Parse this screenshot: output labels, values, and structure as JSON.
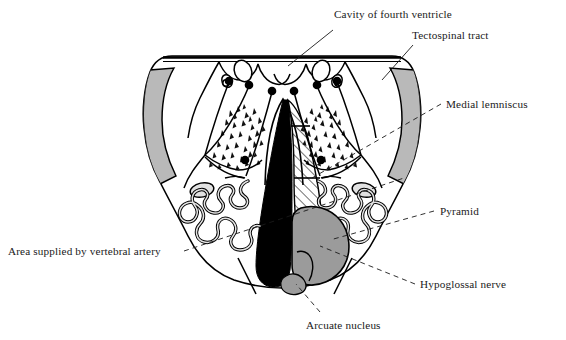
{
  "figure": {
    "background_color": "#ffffff",
    "outline_color": "#000000",
    "gray_light": "#b9b9b9",
    "gray_mid": "#9b9b9b",
    "gray_pale": "#e2e2e2",
    "black_fill": "#000000"
  },
  "labels": {
    "cavity_of_fourth_ventricle": "Cavity of fourth ventricle",
    "tectospinal_tract": "Tectospinal tract",
    "medial_lemniscus": "Medial lemniscus",
    "pyramid": "Pyramid",
    "hypoglossal_nerve": "Hypoglossal nerve",
    "arcuate_nucleus": "Arcuate nucleus",
    "area_supplied_by_vertebral_artery": "Area supplied by vertebral artery"
  },
  "structures": [
    {
      "id": "medulla-outline",
      "name": "Medulla oblongata outline",
      "fill": "#ffffff",
      "stroke": "#000000"
    },
    {
      "id": "vertebral-artery-left",
      "name": "Area supplied by vertebral artery (left)",
      "fill": "#b9b9b9"
    },
    {
      "id": "vertebral-artery-right",
      "name": "Area supplied by vertebral artery (right)",
      "fill": "#b9b9b9"
    },
    {
      "id": "tectospinal-tract",
      "name": "Tectospinal tract (black wedge)",
      "fill": "#000000"
    },
    {
      "id": "medial-lemniscus",
      "name": "Medial lemniscus (hatched column)",
      "fill": "hatch"
    },
    {
      "id": "pyramid",
      "name": "Pyramid",
      "fill": "#9b9b9b"
    },
    {
      "id": "arcuate-nucleus",
      "name": "Arcuate nucleus",
      "fill": "#9b9b9b"
    },
    {
      "id": "inferior-olivary-left",
      "name": "Inferior olivary nucleus (left)",
      "fill": "#e2e2e2"
    },
    {
      "id": "inferior-olivary-right",
      "name": "Inferior olivary nucleus (right)",
      "fill": "#e2e2e2"
    },
    {
      "id": "reticular-stipple-left",
      "name": "Reticular formation stipple (left)"
    },
    {
      "id": "reticular-stipple-right",
      "name": "Reticular formation stipple (right)"
    },
    {
      "id": "fourth-ventricle-floor",
      "name": "Floor / cavity of fourth ventricle"
    }
  ],
  "leader_lines": [
    {
      "for": "cavity_of_fourth_ventricle",
      "style": "solid-thin"
    },
    {
      "for": "tectospinal_tract",
      "style": "solid-thin"
    },
    {
      "for": "medial_lemniscus",
      "style": "dashed"
    },
    {
      "for": "pyramid",
      "style": "dashed"
    },
    {
      "for": "hypoglossal_nerve",
      "style": "dashed"
    },
    {
      "for": "arcuate_nucleus",
      "style": "dashed"
    },
    {
      "for": "area_supplied_by_vertebral_artery",
      "style": "dashed"
    }
  ]
}
